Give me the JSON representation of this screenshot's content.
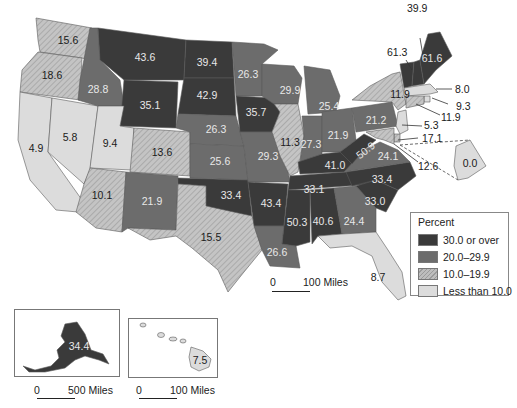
{
  "legend": {
    "title": "Percent",
    "items": [
      {
        "label": "30.0 or over",
        "class": "c1",
        "color": "#3a3a3a"
      },
      {
        "label": "20.0–29.9",
        "class": "c2",
        "color": "#6c6c6c"
      },
      {
        "label": "10.0–19.9",
        "class": "c3",
        "color": "hatched #b5b5b5"
      },
      {
        "label": "Less than 10.0",
        "class": "c4",
        "color": "#dcdcdc"
      }
    ]
  },
  "scales": {
    "main": {
      "zero": "0",
      "label": "100 Miles"
    },
    "alaska": {
      "zero": "0",
      "label": "500 Miles"
    },
    "hawaii": {
      "zero": "0",
      "label": "100 Miles"
    }
  },
  "states": {
    "WA": "15.6",
    "OR": "18.6",
    "CA": "4.9",
    "NV": "5.8",
    "ID": "28.8",
    "MT": "43.6",
    "WY": "35.1",
    "UT": "9.4",
    "AZ": "10.1",
    "CO": "13.6",
    "NM": "21.9",
    "ND": "39.4",
    "SD": "42.9",
    "NE": "26.3",
    "KS": "25.6",
    "OK": "33.4",
    "TX": "15.5",
    "MN": "26.3",
    "IA": "35.7",
    "MO": "29.3",
    "AR": "43.4",
    "LA": "26.6",
    "WI": "29.9",
    "IL": "11.3",
    "MI": "25.4",
    "IN": "27.3",
    "OH": "21.9",
    "KY": "41.0",
    "TN": "33.1",
    "MS": "50.3",
    "AL": "40.6",
    "GA": "24.4",
    "FL": "8.7",
    "SC": "33.0",
    "NC": "33.4",
    "VA": "24.1",
    "WV": "50.9",
    "PA": "21.2",
    "NY": "11.9",
    "ME": "61.6",
    "NH": "39.9",
    "VT": "61.3",
    "MA": "8.0",
    "RI": "9.3",
    "CT": "11.9",
    "NJ": "5.3",
    "DE": "17.1",
    "MD": "12.6",
    "DC": "0.0",
    "AK": "34.4",
    "HI": "7.5"
  }
}
